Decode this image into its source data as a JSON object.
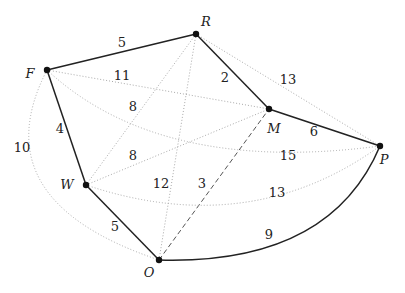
{
  "nodes": [
    {
      "id": "F",
      "x": 47,
      "y": 70,
      "lx": 30,
      "ly": 73
    },
    {
      "id": "R",
      "x": 196,
      "y": 34,
      "lx": 206,
      "ly": 21
    },
    {
      "id": "M",
      "x": 269,
      "y": 109,
      "lx": 274,
      "ly": 128
    },
    {
      "id": "P",
      "x": 380,
      "y": 146,
      "lx": 384,
      "ly": 159
    },
    {
      "id": "W",
      "x": 86,
      "y": 185,
      "lx": 67,
      "ly": 184
    },
    {
      "id": "O",
      "x": 159,
      "y": 260,
      "lx": 149,
      "ly": 272
    }
  ],
  "edges": [
    {
      "from": "F",
      "to": "R",
      "weight": "5",
      "style": "solid",
      "path": "M47,70 L196,34",
      "lx": 122,
      "ly": 42
    },
    {
      "from": "F",
      "to": "W",
      "weight": "4",
      "style": "solid",
      "path": "M47,70 L86,185",
      "lx": 60,
      "ly": 128
    },
    {
      "from": "W",
      "to": "O",
      "weight": "5",
      "style": "solid",
      "path": "M86,185 L159,260",
      "lx": 115,
      "ly": 226
    },
    {
      "from": "R",
      "to": "M",
      "weight": "2",
      "style": "solid",
      "path": "M196,34 L269,109",
      "lx": 225,
      "ly": 77
    },
    {
      "from": "M",
      "to": "P",
      "weight": "6",
      "style": "solid",
      "path": "M269,109 L380,146",
      "lx": 314,
      "ly": 131
    },
    {
      "from": "O",
      "to": "P",
      "weight": "9",
      "style": "solid",
      "path": "M159,260 Q330,265 380,146",
      "lx": 269,
      "ly": 234
    },
    {
      "from": "F",
      "to": "M",
      "weight": "11",
      "style": "dotted",
      "path": "M47,70 L269,109",
      "lx": 122,
      "ly": 75
    },
    {
      "from": "R",
      "to": "W",
      "weight": "8",
      "style": "dotted",
      "path": "M196,34 L86,185",
      "lx": 133,
      "ly": 106
    },
    {
      "from": "W",
      "to": "M",
      "weight": "8",
      "style": "dotted",
      "path": "M86,185 L269,109",
      "lx": 133,
      "ly": 155
    },
    {
      "from": "R",
      "to": "O",
      "weight": "12",
      "style": "dotted",
      "path": "M196,34 L159,260",
      "lx": 161,
      "ly": 183
    },
    {
      "from": "O",
      "to": "M",
      "weight": "3",
      "style": "dashed",
      "path": "M159,260 L269,109",
      "lx": 202,
      "ly": 183
    },
    {
      "from": "F",
      "to": "P",
      "weight": "15",
      "style": "dotted",
      "path": "M47,70 Q160,175 380,146",
      "lx": 288,
      "ly": 155
    },
    {
      "from": "W",
      "to": "P",
      "weight": "13",
      "style": "dotted",
      "path": "M86,185 Q250,240 380,146",
      "lx": 277,
      "ly": 192
    },
    {
      "from": "R",
      "to": "P",
      "weight": "13",
      "style": "dotted",
      "path": "M196,34 L380,146",
      "lx": 288,
      "ly": 79
    },
    {
      "from": "F",
      "to": "O",
      "weight": "10",
      "style": "dotted",
      "path": "M47,70 Q-20,200 159,260",
      "lx": 22,
      "ly": 147
    }
  ]
}
